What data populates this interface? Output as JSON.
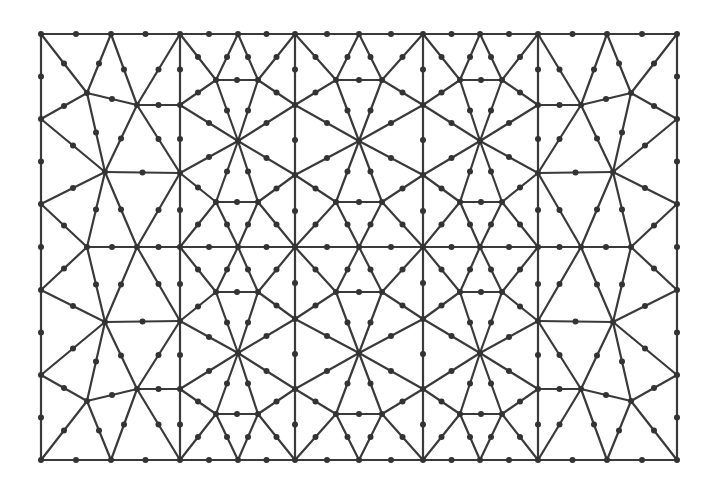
{
  "figure": {
    "type": "finite-element-mesh",
    "bleed_through_text": "",
    "style": {
      "line_color": "#3a3a3a",
      "node_color": "#333333",
      "background": "#ffffff",
      "line_width": 2.2,
      "node_radius": 3.0
    },
    "bounds": {
      "x_min": 41,
      "x_max": 677,
      "y_min": 34,
      "y_max": 460
    },
    "symmetry": {
      "mirror_x_axis_sum": 718,
      "mirror_y_axis_sum": 494,
      "note": "Mesh is mirror-symmetric about x=359 and y=247; the vertices/edges below define the top-left quadrant and are reflected to fill the domain"
    },
    "quadrant_vertices": {
      "A": [
        41,
        34
      ],
      "B": [
        111,
        34
      ],
      "C": [
        180,
        34
      ],
      "P": [
        238,
        34
      ],
      "Q": [
        295,
        34
      ],
      "R": [
        359,
        34
      ],
      "D": [
        87,
        93
      ],
      "F": [
        137,
        105
      ],
      "G": [
        180,
        105
      ],
      "S": [
        216,
        80
      ],
      "T": [
        258,
        80
      ],
      "U": [
        295,
        105
      ],
      "V": [
        336,
        80
      ],
      "E": [
        41,
        119
      ],
      "W": [
        238,
        141
      ],
      "X": [
        359,
        141
      ],
      "H": [
        105,
        172
      ],
      "I": [
        180,
        173
      ],
      "Y": [
        295,
        175
      ],
      "J": [
        41,
        204
      ],
      "Z1": [
        216,
        202
      ],
      "Z2": [
        258,
        202
      ],
      "Z3": [
        336,
        202
      ],
      "K": [
        87,
        247
      ],
      "L": [
        137,
        247
      ],
      "M": [
        180,
        247
      ],
      "N1": [
        238,
        247
      ],
      "N2": [
        295,
        247
      ],
      "N3": [
        359,
        247
      ]
    },
    "quadrant_edges": [
      [
        "A",
        "B"
      ],
      [
        "B",
        "C"
      ],
      [
        "C",
        "P"
      ],
      [
        "P",
        "Q"
      ],
      [
        "Q",
        "R"
      ],
      [
        "A",
        "E"
      ],
      [
        "E",
        "J"
      ],
      [
        "J",
        "J*"
      ],
      [
        "A",
        "D"
      ],
      [
        "B",
        "D"
      ],
      [
        "B",
        "F"
      ],
      [
        "C",
        "F"
      ],
      [
        "C",
        "G"
      ],
      [
        "C",
        "S"
      ],
      [
        "D",
        "E"
      ],
      [
        "D",
        "F"
      ],
      [
        "D",
        "H"
      ],
      [
        "E",
        "H"
      ],
      [
        "F",
        "G"
      ],
      [
        "F",
        "H"
      ],
      [
        "F",
        "I"
      ],
      [
        "G",
        "I"
      ],
      [
        "G",
        "S"
      ],
      [
        "G",
        "W"
      ],
      [
        "P",
        "S"
      ],
      [
        "P",
        "T"
      ],
      [
        "S",
        "T"
      ],
      [
        "S",
        "W"
      ],
      [
        "T",
        "W"
      ],
      [
        "T",
        "U"
      ],
      [
        "Q",
        "T"
      ],
      [
        "Q",
        "U"
      ],
      [
        "Q",
        "V"
      ],
      [
        "R",
        "V"
      ],
      [
        "V",
        "V*"
      ],
      [
        "V",
        "U"
      ],
      [
        "V",
        "X"
      ],
      [
        "U",
        "W"
      ],
      [
        "U",
        "X"
      ],
      [
        "U",
        "Y"
      ],
      [
        "H",
        "I"
      ],
      [
        "H",
        "J"
      ],
      [
        "H",
        "K"
      ],
      [
        "H",
        "L"
      ],
      [
        "I",
        "L"
      ],
      [
        "I",
        "M"
      ],
      [
        "I",
        "Z1"
      ],
      [
        "I",
        "W"
      ],
      [
        "W",
        "Y"
      ],
      [
        "W",
        "Z1"
      ],
      [
        "W",
        "Z2"
      ],
      [
        "X",
        "Y"
      ],
      [
        "X",
        "Z3"
      ],
      [
        "Y",
        "Z2"
      ],
      [
        "Y",
        "Z3"
      ],
      [
        "Y",
        "N2"
      ],
      [
        "Z1",
        "Z2"
      ],
      [
        "Z1",
        "M"
      ],
      [
        "Z1",
        "N1"
      ],
      [
        "Z2",
        "N1"
      ],
      [
        "Z2",
        "N2"
      ],
      [
        "Z3",
        "Z3*"
      ],
      [
        "Z3",
        "N2"
      ],
      [
        "Z3",
        "N3"
      ],
      [
        "J",
        "K"
      ],
      [
        "K",
        "L"
      ],
      [
        "L",
        "M"
      ],
      [
        "M",
        "N1"
      ],
      [
        "N1",
        "N2"
      ],
      [
        "N2",
        "N3"
      ]
    ],
    "mirror_suffix_note": "A name ending in * denotes the reflection of that vertex across the nearest symmetry axis (J* across y=247; V*, Z3* across x=359)"
  }
}
